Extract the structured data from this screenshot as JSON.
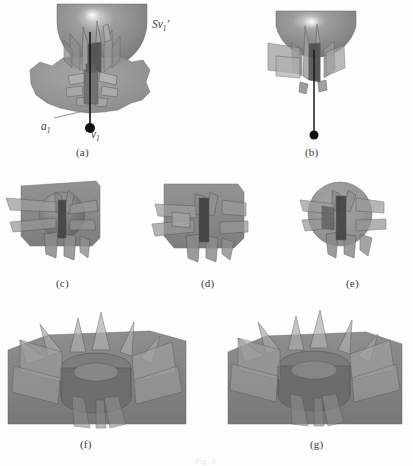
{
  "figure": {
    "kind": "scientific-figure-multipanel",
    "background_color": "#fdfdfd",
    "ink_color": "#3a3a3a",
    "caption_partial": "Fig. 4.",
    "panels": [
      {
        "id": "a",
        "label": "(a)",
        "label_x": 76,
        "label_y": 146
      },
      {
        "id": "b",
        "label": "(b)",
        "label_x": 305,
        "label_y": 146
      },
      {
        "id": "c",
        "label": "(c)",
        "label_x": 56,
        "label_y": 277
      },
      {
        "id": "d",
        "label": "(d)",
        "label_x": 201,
        "label_y": 277
      },
      {
        "id": "e",
        "label": "(e)",
        "label_x": 346,
        "label_y": 277
      },
      {
        "id": "f",
        "label": "(f)",
        "label_x": 80,
        "label_y": 438
      },
      {
        "id": "g",
        "label": "(g)",
        "label_x": 310,
        "label_y": 438
      }
    ],
    "annotations": [
      {
        "name": "sv1-prime-label",
        "text_main": "Sv",
        "text_sub": "1",
        "text_prime": "′",
        "x": 152,
        "y": 18
      },
      {
        "name": "a1-label",
        "text_main": "a",
        "text_sub": "1",
        "text_prime": "",
        "x": 41,
        "y": 120
      },
      {
        "name": "v1-label",
        "text_main": "v",
        "text_sub": "1",
        "text_prime": "",
        "x": 91,
        "y": 128
      }
    ],
    "colors": {
      "surface_gray": "#8d8d8d",
      "surface_gray_dark": "#6f6f6f",
      "surface_gray_light": "#a5a5a5",
      "fin_fill": "#9a9a9a",
      "fin_edge": "#5a5a5a",
      "core_dark": "#5c5c5c",
      "highlight": "#f2f2f2",
      "vertex_dot": "#101010",
      "leader_line": "#6a6a6a"
    }
  }
}
